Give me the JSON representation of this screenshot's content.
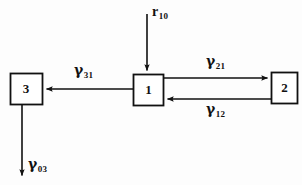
{
  "diagram": {
    "background_color": "#fdfdfd",
    "stroke_color": "#111111",
    "nodes": [
      {
        "id": "box-3",
        "label": "3",
        "x": 10,
        "y": 73,
        "width": 32,
        "height": 32
      },
      {
        "id": "box-1",
        "label": "1",
        "x": 133,
        "y": 74,
        "width": 31,
        "height": 32
      },
      {
        "id": "box-2",
        "label": "2",
        "x": 271,
        "y": 72,
        "width": 27,
        "height": 32
      }
    ],
    "edges": [
      {
        "id": "input-r10",
        "label_base": "r",
        "label_sub": "10",
        "from": "external",
        "to": "box-1",
        "direction": "down",
        "label_x": 152,
        "label_y": 3
      },
      {
        "id": "edge-gamma21",
        "label_base": "γ",
        "label_sub": "21",
        "from": "box-1",
        "to": "box-2",
        "direction": "right",
        "label_x": 206,
        "label_y": 53
      },
      {
        "id": "edge-gamma12",
        "label_base": "γ",
        "label_sub": "12",
        "from": "box-2",
        "to": "box-1",
        "direction": "left",
        "label_x": 206,
        "label_y": 101
      },
      {
        "id": "edge-gamma31",
        "label_base": "γ",
        "label_sub": "31",
        "from": "box-1",
        "to": "box-3",
        "direction": "left",
        "label_x": 74,
        "label_y": 62
      },
      {
        "id": "edge-gamma03",
        "label_base": "γ",
        "label_sub": "03",
        "from": "box-3",
        "to": "external",
        "direction": "down",
        "label_x": 28,
        "label_y": 156
      }
    ]
  }
}
